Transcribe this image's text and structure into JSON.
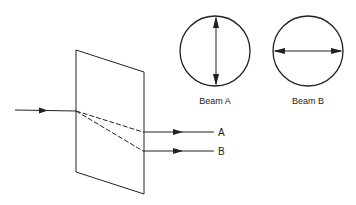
{
  "diagram": {
    "type": "optics-birefringence",
    "stroke_color": "#222222",
    "output_labels": {
      "a": "A",
      "b": "B"
    },
    "polarization_views": [
      {
        "label": "Beam A",
        "arrow_orientation": "vertical"
      },
      {
        "label": "Beam B",
        "arrow_orientation": "horizontal"
      }
    ]
  }
}
